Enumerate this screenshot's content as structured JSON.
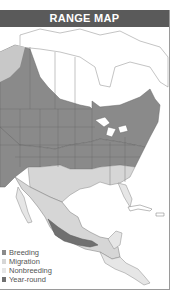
{
  "title": "RANGE MAP",
  "colors": {
    "header_bg": "#5a5a5a",
    "header_text": "#ffffff",
    "breeding": "#8a8a8a",
    "migration": "#d6d6d6",
    "nonbreeding": "#e6e6e6",
    "year_round": "#707070",
    "land_outside": "#ffffff",
    "borders": "#6a6a6a"
  },
  "legend": [
    {
      "label": "Breeding",
      "key": "breeding"
    },
    {
      "label": "Migration",
      "key": "migration"
    },
    {
      "label": "Nonbreeding",
      "key": "nonbreeding"
    },
    {
      "label": "Year-round",
      "key": "year_round"
    }
  ]
}
